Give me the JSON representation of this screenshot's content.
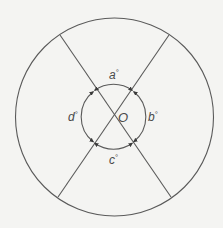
{
  "diagram": {
    "background": "#f4f4f2",
    "stroke_color": "#5a5a5a",
    "text_color": "#4a4a4a",
    "outer_circle": {
      "cx": 114.5,
      "cy": 117,
      "r": 99
    },
    "inner_circle": {
      "cx": 113.5,
      "cy": 116.5,
      "r": 32
    },
    "lines": [
      {
        "name": "diameter-1",
        "x1": 60,
        "y1": 35,
        "x2": 171,
        "y2": 197
      },
      {
        "name": "diameter-2",
        "x1": 169,
        "y1": 35,
        "x2": 58,
        "y2": 197
      }
    ],
    "center_label": "O",
    "angles": [
      {
        "name": "a",
        "label": "a",
        "degree": "°",
        "position": "top"
      },
      {
        "name": "b",
        "label": "b",
        "degree": "°",
        "position": "right"
      },
      {
        "name": "c",
        "label": "c",
        "degree": "°",
        "position": "bottom"
      },
      {
        "name": "d",
        "label": "d",
        "degree": "°",
        "position": "left"
      }
    ]
  }
}
